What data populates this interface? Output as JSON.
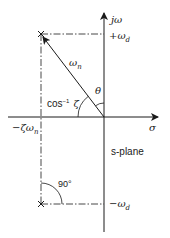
{
  "diagram": {
    "title": "s-plane",
    "axes": {
      "vertical_label": "jω",
      "horizontal_label": "σ"
    },
    "labels": {
      "plus_omega_d": {
        "sign": "+",
        "base": "ω",
        "sub": "d"
      },
      "minus_omega_d": {
        "sign": "−",
        "base": "ω",
        "sub": "d"
      },
      "omega_n": {
        "base": "ω",
        "sub": "n"
      },
      "minus_zeta_omega_n": {
        "sign": "−",
        "base": "ζω",
        "sub": "n"
      },
      "arccos_zeta": {
        "base": "cos",
        "sup": "−1",
        "arg": "ζ"
      },
      "theta": "θ",
      "right_angle": "90°",
      "plane_name": "s-plane"
    },
    "poles": [
      {
        "name": "upper-pole",
        "symbol": "×",
        "x": 41,
        "y": 34
      },
      {
        "name": "lower-pole",
        "symbol": "×",
        "x": 41,
        "y": 204
      }
    ],
    "colors": {
      "ink": "#1a1a1a",
      "background": "#ffffff"
    }
  }
}
